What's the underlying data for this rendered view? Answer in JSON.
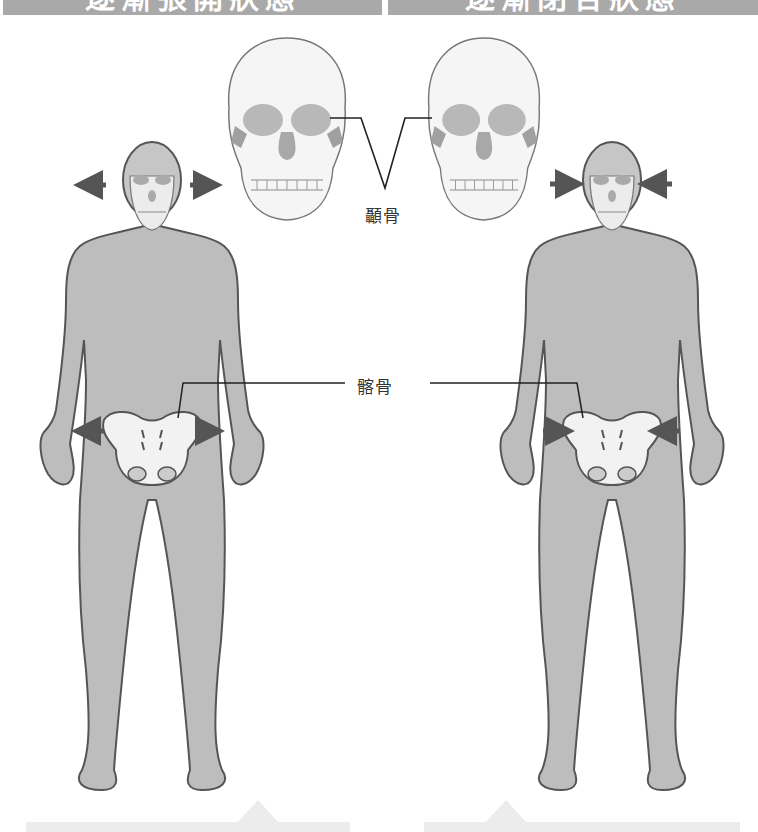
{
  "header": {
    "left_title": "逐漸張開狀態",
    "right_title": "逐漸閉合狀態"
  },
  "labels": {
    "temporal_bone": "顳骨",
    "ilium": "髂骨"
  },
  "figures": [
    {
      "side": "left",
      "state": "expanding",
      "arrows_direction": "outward"
    },
    {
      "side": "right",
      "state": "contracting",
      "arrows_direction": "inward"
    }
  ],
  "colors": {
    "body_fill": "#bdbdbd",
    "outline": "#555555",
    "bone_fill": "#f2f2f2",
    "bone_shade": "#9e9e9e",
    "arrow": "#555555",
    "header_bg": "#a9a9a9"
  }
}
